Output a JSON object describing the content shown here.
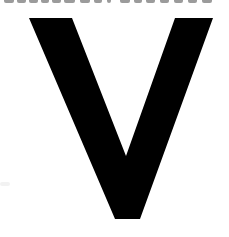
{
  "image": {
    "description": "Large bold black letter cropped from a larger graphic",
    "letter": "V",
    "colors": {
      "background": "#ffffff",
      "glyph": "#000000",
      "cutoff_text": "#7a7a7a"
    }
  },
  "top_strip": {
    "note": "bottom edge of an illegible, cut-off line of text",
    "fragments": [
      {
        "x": 4,
        "w": 10
      },
      {
        "x": 17,
        "w": 9
      },
      {
        "x": 29,
        "w": 9
      },
      {
        "x": 41,
        "w": 8
      },
      {
        "x": 52,
        "w": 9
      },
      {
        "x": 64,
        "w": 11
      },
      {
        "x": 80,
        "w": 10
      },
      {
        "x": 94,
        "w": 8
      },
      {
        "x": 107,
        "w": 4
      },
      {
        "x": 120,
        "w": 10
      },
      {
        "x": 134,
        "w": 8
      },
      {
        "x": 146,
        "w": 9
      },
      {
        "x": 160,
        "w": 9
      },
      {
        "x": 174,
        "w": 9
      },
      {
        "x": 188,
        "w": 9
      },
      {
        "x": 202,
        "w": 10
      }
    ]
  }
}
